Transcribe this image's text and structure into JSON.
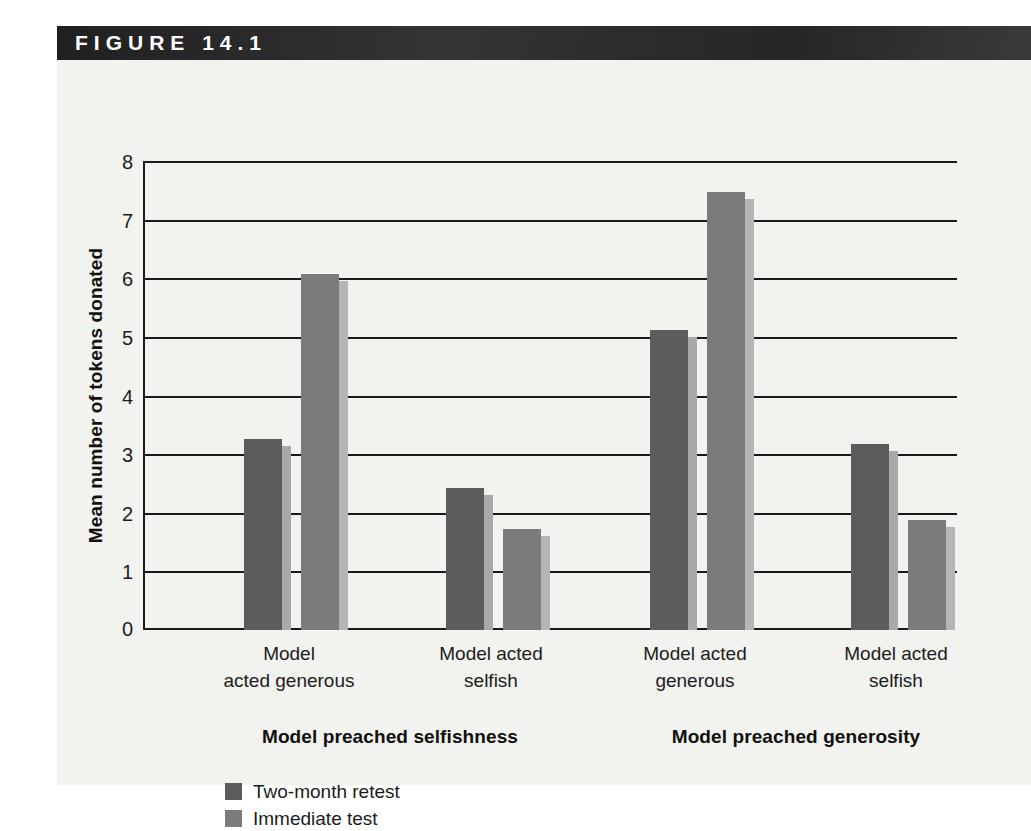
{
  "figure": {
    "header_label": "FIGURE 14.1",
    "header_bar_color": "#2b2b2b",
    "panel_background": "#f2f2ef"
  },
  "chart_data": {
    "type": "bar",
    "title": "",
    "xlabel": "",
    "ylabel": "Mean number of tokens donated",
    "ylim": [
      0,
      8
    ],
    "yticks": [
      "0",
      "1",
      "2",
      "3",
      "4",
      "5",
      "6",
      "7",
      "8"
    ],
    "grid": true,
    "legend_position": "bottom-left",
    "categories": [
      "Model acted generous",
      "Model acted selfish",
      "Model acted generous",
      "Model acted selfish"
    ],
    "category_lines": [
      [
        "Model",
        "acted generous"
      ],
      [
        "Model acted",
        "selfish"
      ],
      [
        "Model acted",
        "generous"
      ],
      [
        "Model acted",
        "selfish"
      ]
    ],
    "panels": [
      {
        "label": "Model preached selfishness",
        "categories": [
          0,
          1
        ]
      },
      {
        "label": "Model preached generosity",
        "categories": [
          2,
          3
        ]
      }
    ],
    "series": [
      {
        "name": "Two-month retest",
        "color": "#5c5c5c",
        "edge_color": "#a9a9a9",
        "values": [
          3.25,
          2.42,
          5.12,
          3.18
        ]
      },
      {
        "name": "Immediate test",
        "color": "#7b7b7b",
        "edge_color": "#b5b5b5",
        "values": [
          6.08,
          1.72,
          7.48,
          1.88
        ]
      }
    ]
  },
  "legend": {
    "items": [
      {
        "label": "Two-month retest",
        "color": "#5c5c5c"
      },
      {
        "label": "Immediate test",
        "color": "#7b7b7b"
      }
    ]
  }
}
